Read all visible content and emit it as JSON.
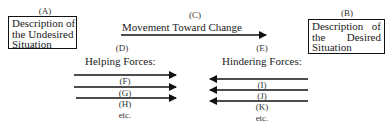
{
  "diagram": {
    "type": "force-field-analysis",
    "box_a": {
      "marker": "(A)",
      "lines": [
        "Description of",
        "the Undesired",
        "Situation"
      ]
    },
    "box_b": {
      "marker": "(B)",
      "lines": [
        "Description of",
        "the  Desired",
        "Situation"
      ]
    },
    "movement": {
      "marker": "(C)",
      "label": "Movement Toward Change",
      "direction": "right"
    },
    "helping": {
      "marker": "(D)",
      "heading": "Helping Forces:",
      "direction": "right",
      "forces": [
        {
          "marker": "(F)"
        },
        {
          "marker": "(G)"
        },
        {
          "marker": "(H)"
        }
      ],
      "more": "etc."
    },
    "hindering": {
      "marker": "(E)",
      "heading": "Hindering Forces:",
      "direction": "left",
      "forces": [
        {
          "marker": "(I)"
        },
        {
          "marker": "(J)"
        },
        {
          "marker": "(K)"
        }
      ],
      "more": "etc."
    },
    "colors": {
      "line": "#111111",
      "text": "#222222",
      "background": "#ffffff"
    }
  }
}
